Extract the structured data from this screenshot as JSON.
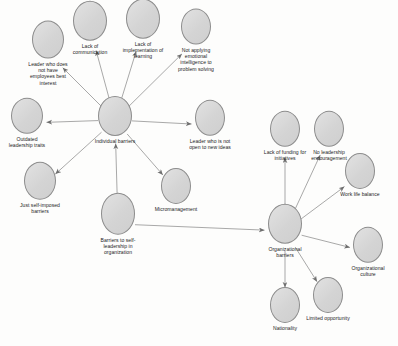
{
  "diagram": {
    "type": "concept-map",
    "colors": {
      "node_fill": "#d9d9d9",
      "node_stroke": "#8d8d8d",
      "edge_stroke": "#6e6e6e",
      "label_text": "#1c1c1c",
      "background": "#fdfdfc"
    },
    "nodes": [
      {
        "id": "root",
        "label": "Barriers to self-\nleadership in\norganization",
        "x": 118,
        "y": 224,
        "rx": 17,
        "ry": 21,
        "label_style": "below",
        "label_width": "narrow"
      },
      {
        "id": "individual",
        "label": "Individual barriers",
        "x": 115,
        "y": 120,
        "rx": 17,
        "ry": 20,
        "label_style": "below",
        "label_width": "narrow"
      },
      {
        "id": "organizational",
        "label": "Organizational\nbarriers",
        "x": 285,
        "y": 231,
        "rx": 17,
        "ry": 20,
        "label_style": "below",
        "label_width": "narrow"
      },
      {
        "id": "lack-communication",
        "label": "Lack of\ncommunication",
        "x": 90,
        "y": 28,
        "rx": 17,
        "ry": 20,
        "label_style": "below",
        "label_width": "narrow"
      },
      {
        "id": "lack-implementation",
        "label": "Lack of\nimplementation of\nlearning",
        "x": 143,
        "y": 29,
        "rx": 17,
        "ry": 20,
        "label_style": "below",
        "label_width": "narrow"
      },
      {
        "id": "not-applying-ei",
        "label": "Not applying\nemotional\nintelligence to\nproblem solving",
        "x": 196,
        "y": 40,
        "rx": 15,
        "ry": 18,
        "label_style": "below",
        "label_width": "narrow"
      },
      {
        "id": "leader-no-interest",
        "label": "Leader who does\nnot have\nemployees best\ninterest",
        "x": 48,
        "y": 53,
        "rx": 16,
        "ry": 19,
        "label_style": "below",
        "label_width": "narrow"
      },
      {
        "id": "outdated-traits",
        "label": "Outdated\nleadership traits",
        "x": 27,
        "y": 123,
        "rx": 16,
        "ry": 18,
        "label_style": "below",
        "label_width": "narrow"
      },
      {
        "id": "self-imposed",
        "label": "Just self-imposed\nbarriers",
        "x": 40,
        "y": 188,
        "rx": 16,
        "ry": 19,
        "label_style": "below",
        "label_width": "narrow"
      },
      {
        "id": "leader-not-open",
        "label": "Leader who is not\nopen to new ideas",
        "x": 210,
        "y": 125,
        "rx": 15,
        "ry": 18,
        "label_style": "below",
        "label_width": "narrow"
      },
      {
        "id": "micromanagement",
        "label": "Micromanagement",
        "x": 176,
        "y": 190,
        "rx": 15,
        "ry": 18,
        "label_style": "below",
        "label_width": "narrow"
      },
      {
        "id": "lack-funding",
        "label": "Lack of funding for\ninitiatives",
        "x": 285,
        "y": 136,
        "rx": 15,
        "ry": 18,
        "label_style": "below",
        "label_width": "narrow"
      },
      {
        "id": "no-leadership-encouragement",
        "label": "No leadership\nencouragement",
        "x": 329,
        "y": 136,
        "rx": 15,
        "ry": 18,
        "label_style": "below",
        "label_width": "narrow"
      },
      {
        "id": "work-life-balance",
        "label": "Work life balance",
        "x": 360,
        "y": 175,
        "rx": 15,
        "ry": 18,
        "label_style": "below",
        "label_width": "narrow"
      },
      {
        "id": "organizational-culture",
        "label": "Organizational\nculture",
        "x": 368,
        "y": 252,
        "rx": 15,
        "ry": 18,
        "label_style": "below",
        "label_width": "narrow"
      },
      {
        "id": "limited-opportunity",
        "label": "Limited opportunity",
        "x": 328,
        "y": 299,
        "rx": 15,
        "ry": 18,
        "label_style": "below",
        "label_width": "narrow"
      },
      {
        "id": "nationality",
        "label": "Nationality",
        "x": 285,
        "y": 309,
        "rx": 15,
        "ry": 18,
        "label_style": "below",
        "label_width": "narrow"
      }
    ],
    "edges": [
      {
        "from": "root",
        "to": "individual",
        "arrow": true
      },
      {
        "from": "root",
        "to": "organizational",
        "arrow": true
      },
      {
        "from": "individual",
        "to": "lack-communication",
        "arrow": true
      },
      {
        "from": "individual",
        "to": "lack-implementation",
        "arrow": true
      },
      {
        "from": "individual",
        "to": "not-applying-ei",
        "arrow": true
      },
      {
        "from": "individual",
        "to": "leader-no-interest",
        "arrow": true
      },
      {
        "from": "individual",
        "to": "outdated-traits",
        "arrow": true
      },
      {
        "from": "individual",
        "to": "self-imposed",
        "arrow": true
      },
      {
        "from": "individual",
        "to": "leader-not-open",
        "arrow": true
      },
      {
        "from": "individual",
        "to": "micromanagement",
        "arrow": true
      },
      {
        "from": "organizational",
        "to": "lack-funding",
        "arrow": true
      },
      {
        "from": "organizational",
        "to": "no-leadership-encouragement",
        "arrow": true
      },
      {
        "from": "organizational",
        "to": "work-life-balance",
        "arrow": true
      },
      {
        "from": "organizational",
        "to": "organizational-culture",
        "arrow": true
      },
      {
        "from": "organizational",
        "to": "limited-opportunity",
        "arrow": true
      },
      {
        "from": "organizational",
        "to": "nationality",
        "arrow": true
      }
    ]
  }
}
